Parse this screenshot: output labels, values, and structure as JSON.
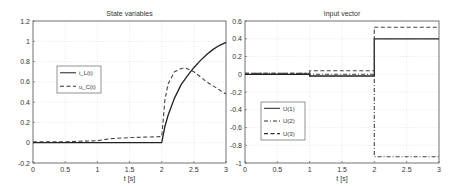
{
  "chart_data": [
    {
      "type": "line",
      "title": "State variables",
      "xlabel": "t [s]",
      "ylabel": "",
      "xlim": [
        0,
        3
      ],
      "ylim": [
        -0.2,
        1.2
      ],
      "xticks": [
        "0",
        "0.5",
        "1",
        "1.5",
        "2",
        "2.5",
        "3"
      ],
      "yticks": [
        "-0.2",
        "0",
        "0.2",
        "0.4",
        "0.6",
        "0.8",
        "1",
        "1.2"
      ],
      "grid": true,
      "legend_position": "center-left",
      "series": [
        {
          "name": "i_L(t)",
          "style": "solid",
          "x": [
            0,
            1,
            1.5,
            2.0,
            2.05,
            2.1,
            2.2,
            2.3,
            2.4,
            2.5,
            2.6,
            2.7,
            2.8,
            2.9,
            3.0
          ],
          "y": [
            0,
            0,
            0,
            0,
            0.16,
            0.27,
            0.44,
            0.57,
            0.66,
            0.74,
            0.81,
            0.87,
            0.92,
            0.96,
            0.99
          ]
        },
        {
          "name": "u_C(t)",
          "style": "dashed",
          "x": [
            0,
            0.5,
            1.0,
            1.2,
            1.5,
            2.0,
            2.02,
            2.05,
            2.1,
            2.2,
            2.3,
            2.35,
            2.4,
            2.5,
            2.6,
            2.7,
            2.8,
            2.9,
            3.0
          ],
          "y": [
            0.01,
            0.01,
            0.02,
            0.04,
            0.05,
            0.06,
            0.2,
            0.42,
            0.58,
            0.7,
            0.73,
            0.74,
            0.73,
            0.7,
            0.65,
            0.6,
            0.56,
            0.52,
            0.48
          ]
        }
      ]
    },
    {
      "type": "line",
      "title": "Input vector",
      "xlabel": "t [s]",
      "ylabel": "",
      "xlim": [
        0,
        3
      ],
      "ylim": [
        -1,
        0.6
      ],
      "xticks": [
        "0",
        "0.5",
        "1",
        "1.5",
        "2",
        "2.5",
        "3"
      ],
      "yticks": [
        "-1",
        "-0.8",
        "-0.6",
        "-0.4",
        "-0.2",
        "0",
        "0.2",
        "0.4",
        "0.6"
      ],
      "grid": true,
      "legend_position": "lower-left",
      "series": [
        {
          "name": "U(1)",
          "style": "solid",
          "x": [
            0,
            1,
            1,
            2,
            2,
            3
          ],
          "y": [
            0,
            0,
            -0.02,
            -0.02,
            0.4,
            0.4
          ]
        },
        {
          "name": "U(2)",
          "style": "dashdot",
          "x": [
            0,
            1,
            1,
            2,
            2,
            3
          ],
          "y": [
            0.01,
            0.01,
            0.0,
            0.0,
            -0.93,
            -0.93
          ]
        },
        {
          "name": "U(3)",
          "style": "dashed",
          "x": [
            0,
            1,
            1,
            2,
            2,
            3
          ],
          "y": [
            0.01,
            0.01,
            0.04,
            0.04,
            0.53,
            0.53
          ]
        }
      ]
    }
  ]
}
